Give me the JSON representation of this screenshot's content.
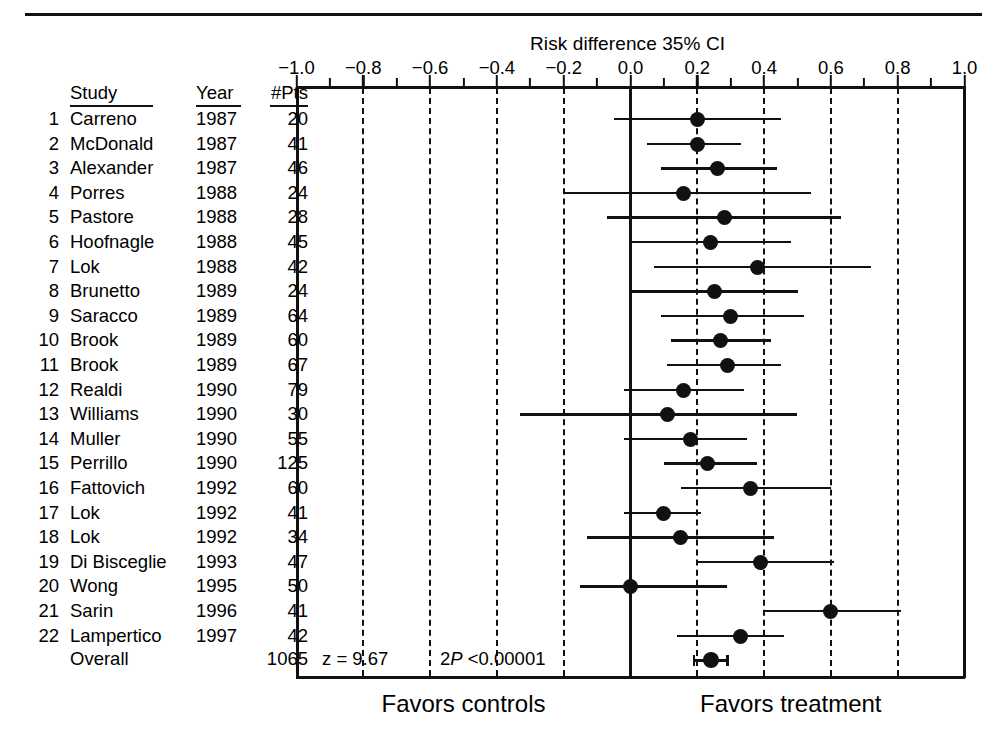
{
  "chart_data": {
    "type": "forest",
    "title": "Risk difference 35% CI",
    "xlabel": "",
    "ylabel": "",
    "xlim": [
      -1.0,
      1.0
    ],
    "xticks": [
      -1.0,
      -0.8,
      -0.6,
      -0.4,
      -0.2,
      0.0,
      0.2,
      0.4,
      0.6,
      0.8,
      1.0
    ],
    "xtick_labels": [
      "−1.0",
      "−0.8",
      "−0.6",
      "−0.4",
      "−0.2",
      "0.0",
      "0.2",
      "0.4",
      "0.6",
      "0.8",
      "1.0"
    ],
    "grid": "dashed vertical at every major tick; solid line at 0.0",
    "legend": "none",
    "null_line": 0.0,
    "columns": [
      "#",
      "Study",
      "Year",
      "#Pts",
      "Risk difference (95% CI)"
    ],
    "column_headers": {
      "study": "Study",
      "year": "Year",
      "pts": "#Pts"
    },
    "rows": [
      {
        "n": "1",
        "study": "Carreno",
        "year": "1987",
        "pts": "20",
        "est": 0.2,
        "lo": -0.05,
        "hi": 0.45
      },
      {
        "n": "2",
        "study": "McDonald",
        "year": "1987",
        "pts": "41",
        "est": 0.2,
        "lo": 0.05,
        "hi": 0.33
      },
      {
        "n": "3",
        "study": "Alexander",
        "year": "1987",
        "pts": "46",
        "est": 0.26,
        "lo": 0.09,
        "hi": 0.44
      },
      {
        "n": "4",
        "study": "Porres",
        "year": "1988",
        "pts": "24",
        "est": 0.16,
        "lo": -0.2,
        "hi": 0.54
      },
      {
        "n": "5",
        "study": "Pastore",
        "year": "1988",
        "pts": "28",
        "est": 0.28,
        "lo": -0.07,
        "hi": 0.63
      },
      {
        "n": "6",
        "study": "Hoofnagle",
        "year": "1988",
        "pts": "45",
        "est": 0.24,
        "lo": 0.0,
        "hi": 0.48
      },
      {
        "n": "7",
        "study": "Lok",
        "year": "1988",
        "pts": "42",
        "est": 0.38,
        "lo": 0.07,
        "hi": 0.72
      },
      {
        "n": "8",
        "study": "Brunetto",
        "year": "1989",
        "pts": "24",
        "est": 0.25,
        "lo": 0.0,
        "hi": 0.5
      },
      {
        "n": "9",
        "study": "Saracco",
        "year": "1989",
        "pts": "64",
        "est": 0.3,
        "lo": 0.09,
        "hi": 0.52
      },
      {
        "n": "10",
        "study": "Brook",
        "year": "1989",
        "pts": "60",
        "est": 0.27,
        "lo": 0.12,
        "hi": 0.42
      },
      {
        "n": "11",
        "study": "Brook",
        "year": "1989",
        "pts": "67",
        "est": 0.29,
        "lo": 0.11,
        "hi": 0.45
      },
      {
        "n": "12",
        "study": "Realdi",
        "year": "1990",
        "pts": "79",
        "est": 0.16,
        "lo": -0.02,
        "hi": 0.34
      },
      {
        "n": "13",
        "study": "Williams",
        "year": "1990",
        "pts": "30",
        "est": 0.11,
        "lo": -0.33,
        "hi": 0.5
      },
      {
        "n": "14",
        "study": "Muller",
        "year": "1990",
        "pts": "55",
        "est": 0.18,
        "lo": -0.02,
        "hi": 0.35
      },
      {
        "n": "15",
        "study": "Perrillo",
        "year": "1990",
        "pts": "125",
        "est": 0.23,
        "lo": 0.1,
        "hi": 0.38
      },
      {
        "n": "16",
        "study": "Fattovich",
        "year": "1992",
        "pts": "60",
        "est": 0.36,
        "lo": 0.15,
        "hi": 0.6
      },
      {
        "n": "17",
        "study": "Lok",
        "year": "1992",
        "pts": "41",
        "est": 0.1,
        "lo": -0.02,
        "hi": 0.21
      },
      {
        "n": "18",
        "study": "Lok",
        "year": "1992",
        "pts": "34",
        "est": 0.15,
        "lo": -0.13,
        "hi": 0.43
      },
      {
        "n": "19",
        "study": "Di Bisceglie",
        "year": "1993",
        "pts": "47",
        "est": 0.39,
        "lo": 0.2,
        "hi": 0.61
      },
      {
        "n": "20",
        "study": "Wong",
        "year": "1995",
        "pts": "50",
        "est": 0.0,
        "lo": -0.15,
        "hi": 0.29
      },
      {
        "n": "21",
        "study": "Sarin",
        "year": "1996",
        "pts": "41",
        "est": 0.6,
        "lo": 0.4,
        "hi": 0.81
      },
      {
        "n": "22",
        "study": "Lampertico",
        "year": "1997",
        "pts": "42",
        "est": 0.33,
        "lo": 0.14,
        "hi": 0.46
      }
    ],
    "overall": {
      "label": "Overall",
      "pts": "1065",
      "est": 0.24,
      "lo": 0.19,
      "hi": 0.29,
      "z_text": "z =   9.67",
      "p_prefix": "2",
      "p_italic": "P",
      "p_suffix": " <0.00001"
    },
    "footer": {
      "left_label": "Favors controls",
      "right_label": "Favors treatment"
    },
    "colors": {
      "ink": "#111111",
      "background": "#ffffff"
    }
  }
}
